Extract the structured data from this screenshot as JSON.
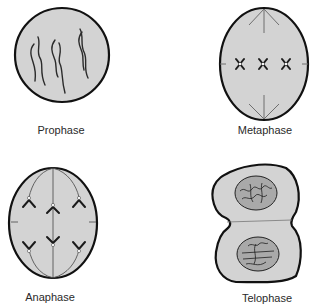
{
  "diagram": {
    "colors": {
      "cell_fill": "#d3d3d3",
      "nucleus_fill": "#a9a9a9",
      "outline": "#111111",
      "chromosome": "#2b2b2b",
      "spindle": "#6f6f6f"
    },
    "panels": [
      {
        "id": "prophase",
        "label": "Prophase"
      },
      {
        "id": "metaphase",
        "label": "Metaphase"
      },
      {
        "id": "anaphase",
        "label": "Anaphase"
      },
      {
        "id": "telophase",
        "label": "Telophase"
      }
    ]
  }
}
